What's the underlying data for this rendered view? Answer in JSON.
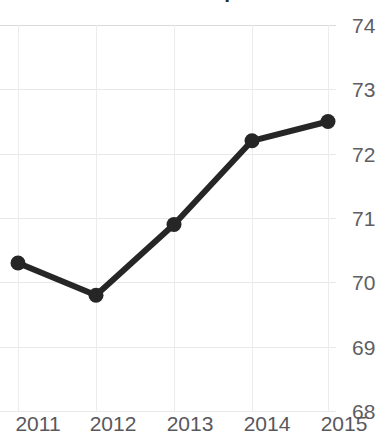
{
  "chart_data": {
    "type": "line",
    "title": "Western Europe",
    "xlabel": "",
    "ylabel": "",
    "categories": [
      "2011",
      "2012",
      "2013",
      "2014",
      "2015"
    ],
    "x": [
      2011,
      2012,
      2013,
      2014,
      2015
    ],
    "values": [
      70.3,
      69.8,
      70.9,
      72.2,
      72.5
    ],
    "series": [
      {
        "name": "Western Europe",
        "values": [
          70.3,
          69.8,
          70.9,
          72.2,
          72.5
        ]
      }
    ],
    "ylim": [
      68,
      74
    ],
    "yticks": [
      74,
      73,
      72,
      71,
      70,
      69,
      68
    ],
    "ytick_labels": [
      "74",
      "73",
      "72",
      "71",
      "70",
      "69",
      "68"
    ],
    "xtick_labels": [
      "2011",
      "2012",
      "2013",
      "2014",
      "2015"
    ],
    "grid": true,
    "legend": false,
    "legend_position": "none",
    "line_color": "#262626",
    "marker_color": "#262626",
    "marker": "circle",
    "grid_color": "#e8e8ea",
    "title_color": "#2b2b2b",
    "tick_label_color": "#5e5e63"
  }
}
